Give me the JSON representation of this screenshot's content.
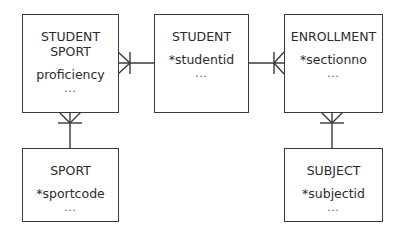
{
  "diagram": {
    "type": "entity-relationship",
    "entities": [
      {
        "id": "student_sport",
        "name": "STUDENT\nSPORT",
        "attribute": "proficiency",
        "more": "..."
      },
      {
        "id": "student",
        "name": "STUDENT",
        "attribute": "*studentid",
        "more": "..."
      },
      {
        "id": "enrollment",
        "name": "ENROLLMENT",
        "attribute": "*sectionno",
        "more": "..."
      },
      {
        "id": "sport",
        "name": "SPORT",
        "attribute": "*sportcode",
        "more": "..."
      },
      {
        "id": "subject",
        "name": "SUBJECT",
        "attribute": "*subjectid",
        "more": "..."
      }
    ],
    "relationships": [
      {
        "from": "student",
        "to": "student_sport",
        "cardinality": "one-to-many",
        "many_end": "student_sport"
      },
      {
        "from": "student",
        "to": "enrollment",
        "cardinality": "one-to-many",
        "many_end": "enrollment"
      },
      {
        "from": "sport",
        "to": "student_sport",
        "cardinality": "one-to-many",
        "many_end": "student_sport"
      },
      {
        "from": "subject",
        "to": "enrollment",
        "cardinality": "one-to-many",
        "many_end": "enrollment"
      }
    ],
    "colors": {
      "line": "#3a3a3a",
      "background": "#ffffff",
      "text": "#2b2b2b"
    }
  }
}
